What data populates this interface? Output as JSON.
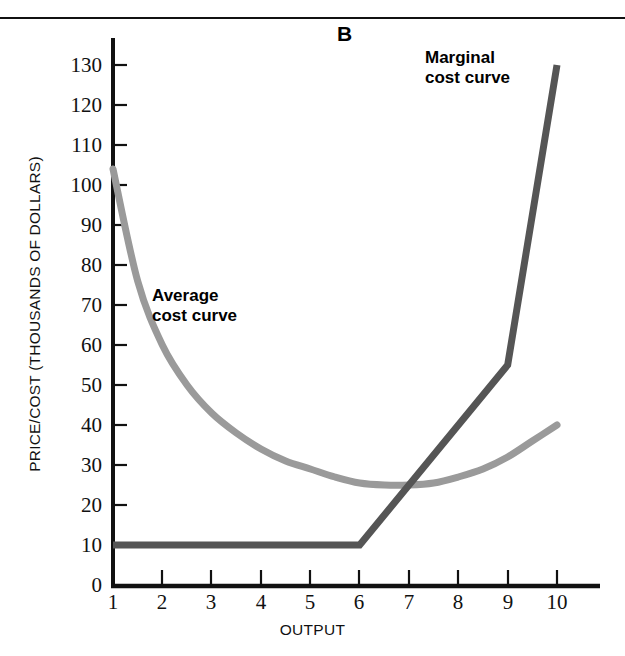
{
  "figure": {
    "panel_letter": "B",
    "top_rule_color": "#111111"
  },
  "axes": {
    "y_title": "PRICE/COST (THOUSANDS OF DOLLARS)",
    "x_title": "OUTPUT",
    "y_ticks": [
      "0",
      "10",
      "20",
      "30",
      "40",
      "50",
      "60",
      "70",
      "80",
      "90",
      "100",
      "110",
      "120",
      "130"
    ],
    "x_ticks": [
      "1",
      "2",
      "3",
      "4",
      "5",
      "6",
      "7",
      "8",
      "9",
      "10"
    ],
    "axis_color": "#111111"
  },
  "annotations": {
    "average_label": "Average\ncost curve",
    "marginal_label": "Marginal\ncost curve"
  },
  "colors": {
    "average_curve": "#9a9a9a",
    "marginal_curve": "#555555",
    "axis": "#111111",
    "background": "#ffffff"
  },
  "chart_data": {
    "type": "line",
    "title": "B",
    "xlabel": "OUTPUT",
    "ylabel": "PRICE/COST (THOUSANDS OF DOLLARS)",
    "xlim": [
      1,
      10
    ],
    "ylim": [
      0,
      130
    ],
    "y_tick_step": 10,
    "x_tick_step": 1,
    "grid": false,
    "legend": "inline-annotations",
    "series": [
      {
        "name": "Average cost curve",
        "color": "#9a9a9a",
        "style": "smooth",
        "x": [
          1,
          1.5,
          2,
          2.5,
          3,
          3.5,
          4,
          4.5,
          5,
          5.5,
          6,
          6.5,
          7,
          7.5,
          8,
          8.5,
          9,
          9.5,
          10
        ],
        "values": [
          104,
          76,
          60,
          50,
          43,
          38,
          34,
          31,
          29,
          27,
          25.5,
          25,
          25,
          25.5,
          27,
          29,
          32,
          36,
          40
        ]
      },
      {
        "name": "Marginal cost curve",
        "color": "#555555",
        "style": "piecewise-linear",
        "x": [
          1,
          6,
          9,
          10
        ],
        "values": [
          10,
          10,
          55,
          130
        ]
      }
    ],
    "annotations": [
      {
        "text": "Average cost curve",
        "x": 2.1,
        "y": 67
      },
      {
        "text": "Marginal cost curve",
        "x": 7.4,
        "y": 122
      },
      {
        "text": "B",
        "x": 5.6,
        "y": 131
      }
    ],
    "notes": {
      "intersection": {
        "x": 7,
        "y": 25
      },
      "average_minimum": {
        "x": 6.75,
        "y": 25
      },
      "marginal_flat_range": [
        1,
        6
      ],
      "marginal_flat_value": 10
    }
  }
}
